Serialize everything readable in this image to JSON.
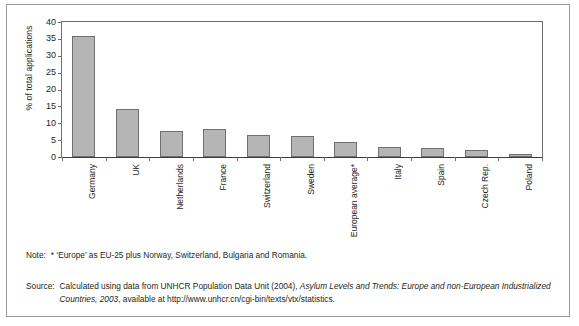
{
  "chart_data": {
    "type": "bar",
    "title": "",
    "xlabel": "",
    "ylabel": "% of total applications",
    "ylim": [
      0,
      40
    ],
    "yticks": [
      "0",
      "5",
      "10",
      "15",
      "20",
      "25",
      "30",
      "35",
      "40"
    ],
    "ytick_values": [
      0,
      5,
      10,
      15,
      20,
      25,
      30,
      35,
      40
    ],
    "grid": false,
    "legend": "none",
    "categories": [
      "Germany",
      "UK",
      "Netherlands",
      "France",
      "Switzerland",
      "Sweden",
      "European average*",
      "Italy",
      "Spain",
      "Czech Rep.",
      "Poland"
    ],
    "values": [
      35.8,
      14.1,
      7.7,
      8.2,
      6.5,
      6.2,
      4.5,
      3.0,
      2.7,
      2.2,
      1.0
    ],
    "bar_color": "#b5b5b5",
    "bar_edge_color": "#707070"
  },
  "notes": {
    "note_label": "Note:",
    "note_text": "* ‘Europe’ as EU-25 plus Norway, Switzerland, Bulgaria and Romania.",
    "source_label": "Source:",
    "source_part1": "Calculated using data from UNHCR Population Data Unit (2004), ",
    "source_italic1": "Asylum Levels and Trends: Europe and non-European Industrialized Countries, 2003",
    "source_part2": ",  available at http://www.unhcr.cn/cgi-bin/texts/vtx/statistics."
  }
}
